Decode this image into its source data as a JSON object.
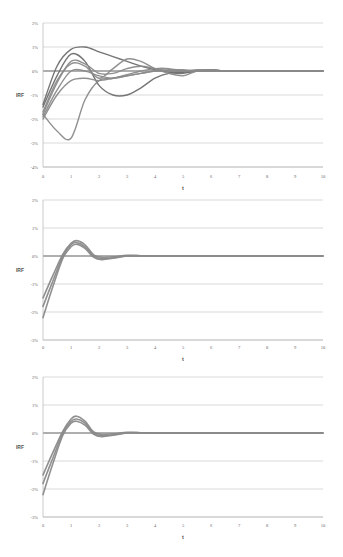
{
  "chart_data": [
    {
      "type": "line",
      "title": "",
      "xlabel": "t",
      "ylabel": "IRF",
      "xlim": [
        0,
        10
      ],
      "ylim": [
        -4,
        2
      ],
      "x_ticks": [
        "0",
        "1",
        "2",
        "3",
        "4",
        "5",
        "6",
        "7",
        "8",
        "9",
        "10"
      ],
      "y_ticks": [
        "2%",
        "1%",
        "0%",
        "-1%",
        "-2%",
        "-3%",
        "-4%"
      ],
      "grid": "horizontal",
      "legend": "none",
      "x": [
        0,
        0.5,
        1,
        1.5,
        2,
        2.5,
        3,
        3.5,
        4,
        4.5,
        5,
        5.5,
        6,
        6.5,
        7,
        8,
        9,
        10
      ],
      "series": [
        {
          "name": "series-1",
          "values": [
            -1.4,
            0.2,
            0.9,
            1.0,
            0.8,
            0.6,
            0.4,
            0.2,
            0.05,
            -0.05,
            -0.05,
            0.0,
            0.05,
            0.0,
            0.0,
            0.0,
            0.0,
            0.0
          ]
        },
        {
          "name": "series-2",
          "values": [
            -1.5,
            -0.2,
            0.7,
            0.4,
            -0.6,
            -1.0,
            -1.0,
            -0.7,
            -0.3,
            -0.1,
            -0.1,
            0.0,
            0.05,
            0.0,
            0.0,
            0.0,
            0.0,
            0.0
          ]
        },
        {
          "name": "series-3",
          "values": [
            -1.7,
            -0.4,
            0.3,
            0.2,
            -0.3,
            0.1,
            0.5,
            0.4,
            0.1,
            -0.1,
            -0.2,
            0.0,
            0.0,
            0.0,
            0.0,
            0.0,
            0.0,
            0.0
          ]
        },
        {
          "name": "series-4",
          "values": [
            -1.8,
            -0.5,
            0.4,
            0.3,
            -0.1,
            -0.1,
            0.1,
            0.2,
            0.1,
            0.0,
            0.0,
            0.05,
            0.05,
            0.0,
            0.0,
            0.0,
            0.0,
            0.0
          ]
        },
        {
          "name": "series-5",
          "values": [
            -1.9,
            -0.8,
            0.0,
            0.0,
            -0.2,
            -0.3,
            -0.2,
            -0.1,
            0.0,
            0.05,
            0.05,
            0.0,
            0.0,
            0.0,
            0.0,
            0.0,
            0.0,
            0.0
          ]
        },
        {
          "name": "series-6",
          "values": [
            -2.0,
            -1.0,
            -0.4,
            -0.3,
            -0.4,
            -0.3,
            -0.2,
            -0.1,
            0.0,
            0.0,
            0.0,
            0.0,
            0.0,
            0.0,
            0.0,
            0.0,
            0.0,
            0.0
          ]
        },
        {
          "name": "series-7",
          "values": [
            -1.8,
            -2.5,
            -2.8,
            -1.2,
            -0.4,
            -0.3,
            -0.15,
            0.0,
            0.1,
            0.1,
            0.0,
            0.0,
            0.0,
            0.0,
            0.0,
            0.0,
            0.0,
            0.0
          ]
        }
      ]
    },
    {
      "type": "line",
      "title": "",
      "xlabel": "t",
      "ylabel": "IRF",
      "xlim": [
        0,
        10
      ],
      "ylim": [
        -3,
        2
      ],
      "x_ticks": [
        "0",
        "1",
        "2",
        "3",
        "4",
        "5",
        "6",
        "7",
        "8",
        "9",
        "10"
      ],
      "y_ticks": [
        "2%",
        "1%",
        "0%",
        "-1%",
        "-2%",
        "-3%"
      ],
      "grid": "horizontal",
      "legend": "none",
      "x": [
        0,
        0.35,
        0.7,
        1.0,
        1.2,
        1.5,
        1.8,
        2.1,
        2.5,
        3.0,
        3.5,
        4,
        5,
        6,
        7,
        8,
        9,
        10
      ],
      "series": [
        {
          "name": "upper",
          "values": [
            -1.5,
            -0.7,
            0.05,
            0.45,
            0.55,
            0.4,
            0.05,
            -0.05,
            -0.03,
            0.02,
            0.01,
            0.0,
            0.0,
            0.0,
            0.0,
            0.0,
            0.0,
            0.0
          ]
        },
        {
          "name": "middle",
          "values": [
            -1.8,
            -0.9,
            -0.02,
            0.4,
            0.48,
            0.33,
            0.0,
            -0.1,
            -0.06,
            0.01,
            0.01,
            0.0,
            0.0,
            0.0,
            0.0,
            0.0,
            0.0,
            0.0
          ]
        },
        {
          "name": "lower",
          "values": [
            -2.2,
            -1.1,
            -0.1,
            0.33,
            0.42,
            0.27,
            -0.04,
            -0.13,
            -0.08,
            0.0,
            0.0,
            0.0,
            0.0,
            0.0,
            0.0,
            0.0,
            0.0,
            0.0
          ]
        }
      ]
    },
    {
      "type": "line",
      "title": "",
      "xlabel": "t",
      "ylabel": "IRF",
      "xlim": [
        0,
        10
      ],
      "ylim": [
        -3,
        2
      ],
      "x_ticks": [
        "0",
        "1",
        "2",
        "3",
        "4",
        "5",
        "6",
        "7",
        "8",
        "9",
        "10"
      ],
      "y_ticks": [
        "2%",
        "1%",
        "0%",
        "-1%",
        "-2%",
        "-3%"
      ],
      "grid": "horizontal",
      "legend": "none",
      "x": [
        0,
        0.35,
        0.7,
        1.0,
        1.2,
        1.5,
        1.8,
        2.1,
        2.5,
        3.0,
        3.5,
        4,
        5,
        6,
        7,
        8,
        9,
        10
      ],
      "series": [
        {
          "name": "upper",
          "values": [
            -1.5,
            -0.7,
            0.05,
            0.5,
            0.6,
            0.42,
            0.05,
            -0.05,
            -0.03,
            0.02,
            0.01,
            0.0,
            0.0,
            0.0,
            0.0,
            0.0,
            0.0,
            0.0
          ]
        },
        {
          "name": "middle",
          "values": [
            -1.8,
            -0.9,
            -0.02,
            0.42,
            0.5,
            0.35,
            0.0,
            -0.1,
            -0.06,
            0.01,
            0.01,
            0.0,
            0.0,
            0.0,
            0.0,
            0.0,
            0.0,
            0.0
          ]
        },
        {
          "name": "lower",
          "values": [
            -2.2,
            -1.1,
            -0.1,
            0.35,
            0.42,
            0.28,
            -0.04,
            -0.13,
            -0.08,
            0.0,
            0.0,
            0.0,
            0.0,
            0.0,
            0.0,
            0.0,
            0.0,
            0.0
          ]
        }
      ]
    }
  ],
  "style": {
    "line_color": "#8a8a8a",
    "dark_line_color": "#6f6f6f",
    "grid_color": "#cfcfcf",
    "axis_color": "#bdbdbd",
    "zero_line_color": "#9a9a9a"
  },
  "layout": [
    {
      "top": 23,
      "bottom": 167,
      "xlabel_y": 178,
      "t_y": 190,
      "irf_y": 97
    },
    {
      "top": 200,
      "bottom": 340,
      "xlabel_y": 349,
      "t_y": 361,
      "irf_y": 272
    },
    {
      "top": 377,
      "bottom": 517,
      "xlabel_y": 527,
      "t_y": 539,
      "irf_y": 449
    }
  ]
}
